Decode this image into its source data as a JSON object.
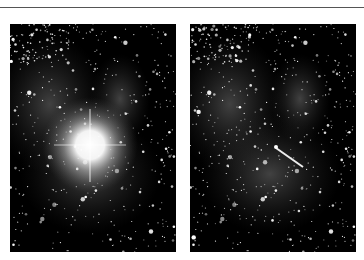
{
  "figure": {
    "panels": [
      {
        "id": "left",
        "content": "star field with very bright central star and diffuse nebula"
      },
      {
        "id": "right",
        "content": "same star field with bright star removed, showing a linear streak"
      }
    ],
    "colors": {
      "background": "#ffffff",
      "sky": "#000000",
      "rule": "#555555"
    }
  }
}
